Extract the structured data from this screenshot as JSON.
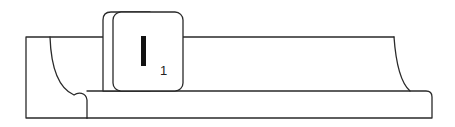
{
  "illustration": {
    "subject": "letter tile on tile rack",
    "tile": {
      "letter": "I",
      "value": "1"
    },
    "colors": {
      "line": "#2a2a2a",
      "background": "#ffffff",
      "letter": "#111111"
    }
  }
}
